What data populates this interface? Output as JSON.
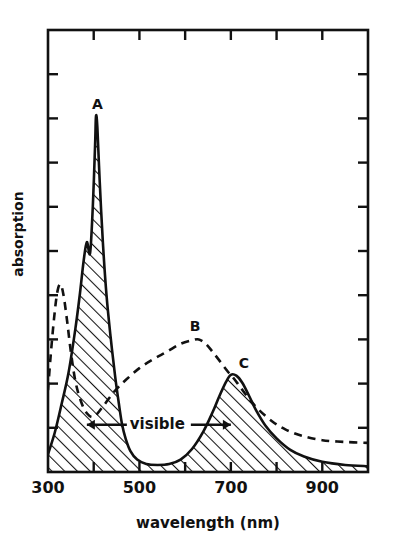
{
  "chart_data": {
    "type": "line",
    "title": "",
    "xlabel": "wavelength (nm)",
    "ylabel": "absorption",
    "xlim": [
      300,
      1000
    ],
    "ylim": [
      0,
      1
    ],
    "grid": false,
    "legend": "none",
    "xticks": [
      300,
      500,
      700,
      900
    ],
    "xtick_labels": [
      "300",
      "500",
      "700",
      "900"
    ],
    "xminor_ticks": [
      400,
      600,
      800,
      1000
    ],
    "ytick_count": 9,
    "ytick_labels": [],
    "annotations": [
      {
        "label": "A",
        "x": 405,
        "y": 0.805,
        "series": "solid-hatched"
      },
      {
        "label": "B",
        "x": 630,
        "y": 0.3,
        "series": "dashed"
      },
      {
        "label": "C",
        "x": 700,
        "y": 0.22,
        "series": "solid-hatched"
      },
      {
        "label": "visible",
        "x_start": 385,
        "x_end": 700,
        "y": 0.107,
        "style": "double-arrow"
      }
    ],
    "series": [
      {
        "name": "solid-hatched",
        "style": "solid",
        "fill": "diagonal-hatch",
        "x": [
          300,
          315,
          330,
          345,
          360,
          370,
          378,
          385,
          392,
          398,
          403,
          405,
          408,
          413,
          420,
          428,
          437,
          447,
          455,
          462,
          470,
          480,
          495,
          515,
          540,
          565,
          590,
          615,
          640,
          660,
          675,
          690,
          700,
          712,
          725,
          740,
          755,
          775,
          800,
          830,
          860,
          900,
          950,
          1000
        ],
        "y": [
          0.04,
          0.09,
          0.155,
          0.225,
          0.325,
          0.405,
          0.478,
          0.52,
          0.495,
          0.6,
          0.74,
          0.805,
          0.78,
          0.66,
          0.52,
          0.4,
          0.305,
          0.215,
          0.155,
          0.108,
          0.075,
          0.048,
          0.028,
          0.018,
          0.016,
          0.018,
          0.028,
          0.052,
          0.092,
          0.135,
          0.172,
          0.205,
          0.22,
          0.218,
          0.202,
          0.172,
          0.14,
          0.106,
          0.076,
          0.05,
          0.035,
          0.023,
          0.016,
          0.013
        ]
      },
      {
        "name": "dashed",
        "style": "dashed",
        "fill": "none",
        "x": [
          300,
          306,
          313,
          320,
          327,
          334,
          342,
          350,
          360,
          372,
          385,
          400,
          420,
          445,
          470,
          500,
          530,
          560,
          590,
          615,
          630,
          645,
          660,
          678,
          695,
          700,
          715,
          735,
          760,
          790,
          820,
          855,
          900,
          950,
          1000
        ],
        "y": [
          0.185,
          0.265,
          0.345,
          0.405,
          0.425,
          0.4,
          0.34,
          0.272,
          0.205,
          0.16,
          0.133,
          0.125,
          0.148,
          0.182,
          0.208,
          0.235,
          0.255,
          0.272,
          0.29,
          0.298,
          0.3,
          0.29,
          0.272,
          0.248,
          0.225,
          0.22,
          0.2,
          0.172,
          0.142,
          0.115,
          0.096,
          0.082,
          0.072,
          0.068,
          0.066
        ]
      }
    ]
  },
  "axes": {
    "ylabel": "absorption",
    "xlabel": "wavelength (nm)",
    "xtick_labels": [
      "300",
      "500",
      "700",
      "900"
    ]
  },
  "labels": {
    "peak_a": "A",
    "peak_b": "B",
    "peak_c": "C",
    "visible_range": "visible"
  }
}
